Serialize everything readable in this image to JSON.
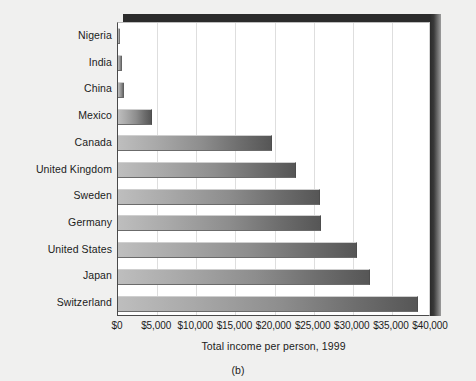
{
  "figure": {
    "caption": "(b)",
    "xaxis_title": "Total income per person, 1999"
  },
  "colors": {
    "background": "#f0f0ef",
    "plot_background": "#ffffff",
    "bar_light": "#bebebe",
    "bar_dark": "#565656",
    "frame": "#2b2b2b",
    "gridline": "#dedede",
    "text": "#1b1b1b"
  },
  "chart_data": {
    "type": "bar",
    "orientation": "horizontal",
    "title": "",
    "xlabel": "Total income per person, 1999",
    "ylabel": "",
    "xlim": [
      0,
      40000
    ],
    "grid": true,
    "legend": "none",
    "tick_labels": [
      "$0",
      "$5,000",
      "$10,000",
      "$15,000",
      "$20,000",
      "$25,000",
      "$30,000",
      "$35,000",
      "$40,000"
    ],
    "tick_values": [
      0,
      5000,
      10000,
      15000,
      20000,
      25000,
      30000,
      35000,
      40000
    ],
    "categories": [
      "Nigeria",
      "India",
      "China",
      "Mexico",
      "Canada",
      "United Kingdom",
      "Sweden",
      "Germany",
      "United States",
      "Japan",
      "Switzerland"
    ],
    "values": [
      310,
      450,
      780,
      4400,
      19700,
      22800,
      25800,
      25900,
      30600,
      32200,
      38400
    ]
  }
}
